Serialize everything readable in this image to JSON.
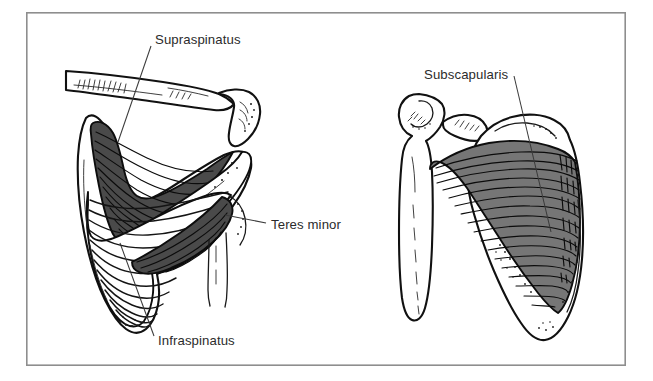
{
  "figure": {
    "background_color": "#ffffff",
    "frame": {
      "border_color": "#8e8e8e",
      "x": 26,
      "y": 12,
      "width": 600,
      "height": 354
    },
    "palette": {
      "ink": "#111111",
      "muscle_dark": "#4a4a4a",
      "muscle_mid": "#767676",
      "label_text": "#2b2b2b",
      "leader_line": "#3a3a3a",
      "paper": "#ffffff"
    },
    "panels": [
      {
        "id": "posterior-view",
        "name": "posterior-scapula-view",
        "position": "left"
      },
      {
        "id": "anterior-view",
        "name": "anterior-scapula-view",
        "position": "right"
      }
    ],
    "annotations": [
      {
        "id": "supraspinatus",
        "label": "Supraspinatus",
        "panel": "posterior-view",
        "text_x": 155,
        "text_y": 44,
        "anchor": "start",
        "leader": "M151,46 L118,142"
      },
      {
        "id": "teres-minor",
        "label": "Teres minor",
        "panel": "posterior-view",
        "text_x": 271,
        "text_y": 229,
        "anchor": "start",
        "leader": "M266,223 L225,215"
      },
      {
        "id": "infraspinatus",
        "label": "Infraspinatus",
        "panel": "posterior-view",
        "text_x": 158,
        "text_y": 345,
        "anchor": "start",
        "leader": "M154,336 L120,243"
      },
      {
        "id": "subscapularis",
        "label": "Subscapularis",
        "panel": "anterior-view",
        "text_x": 424,
        "text_y": 79,
        "anchor": "start",
        "leader": "M514,76 L551,232"
      }
    ]
  }
}
